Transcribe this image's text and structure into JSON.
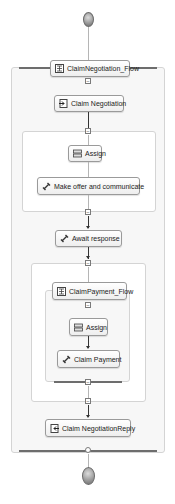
{
  "diagram": {
    "type": "bpel-process-flow",
    "start_node": {
      "shape": "circle",
      "role": "start"
    },
    "end_node": {
      "shape": "circle",
      "role": "end"
    },
    "outer_flow": {
      "label": "ClaimNegotiation_Flow",
      "icon": "flow-icon"
    },
    "nodes": {
      "claim_negotiation": {
        "label": "Claim Negotiation",
        "icon": "receive-icon"
      },
      "assign_1": {
        "label": "Assign",
        "icon": "assign-icon"
      },
      "make_offer": {
        "label": "Make offer and communicate",
        "icon": "invoke-icon"
      },
      "await_response": {
        "label": "Await response",
        "icon": "invoke-icon"
      },
      "assign_2": {
        "label": "Assign",
        "icon": "assign-icon"
      },
      "claim_payment": {
        "label": "Claim Payment",
        "icon": "invoke-icon"
      },
      "claim_negotiation_reply": {
        "label": "Claim NegotiationReply",
        "icon": "reply-icon"
      }
    },
    "inner_flow": {
      "label": "ClaimPayment_Flow",
      "icon": "flow-icon"
    },
    "colors": {
      "edge": "#333333",
      "container_border": "#d4d4d4",
      "container_fill": "#f7f7f7",
      "node_border": "#9a9a9a"
    }
  }
}
